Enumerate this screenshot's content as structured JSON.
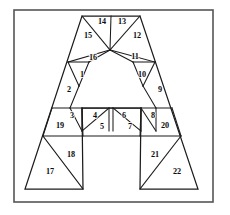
{
  "figure": {
    "background_color": "#ffffff",
    "ink_color": "#1b1b1b",
    "frame_color": "#555555",
    "frame": {
      "x": 14,
      "y": 10,
      "width": 199,
      "height": 192
    }
  },
  "chart_data": {
    "type": "diagram",
    "title": "",
    "region_count": 22,
    "vertices": {
      "apex_left": [
        82,
        16
      ],
      "apex_right": [
        140,
        16
      ],
      "hub": [
        110,
        50
      ],
      "shoulder_left": [
        68,
        62
      ],
      "shoulder_right": [
        155,
        62
      ],
      "bar_top_left": [
        52,
        108
      ],
      "bar_top_right": [
        172,
        108
      ],
      "bar_bottom_left": [
        43,
        136
      ],
      "bar_bottom_right": [
        181,
        136
      ],
      "foot_left_outer": [
        25,
        189
      ],
      "foot_left_inner": [
        83,
        189
      ],
      "foot_right_inner": [
        140,
        189
      ],
      "foot_right_outer": [
        198,
        189
      ],
      "counter_left": [
        82,
        108
      ],
      "counter_right": [
        141,
        108
      ],
      "inner_left_top": [
        89,
        62
      ],
      "inner_right_top": [
        133,
        62
      ]
    },
    "regions": [
      {
        "id": 1,
        "label": "1",
        "label_x": 82,
        "label_y": 75,
        "points": "68,62 89,62 79,86"
      },
      {
        "id": 2,
        "label": "2",
        "label_x": 69,
        "label_y": 90,
        "points": "68,62 79,86 70,108 52,108"
      },
      {
        "id": 3,
        "label": "3",
        "label_x": 72,
        "label_y": 116,
        "points": "70,108 82,108 82,131"
      },
      {
        "id": 4,
        "label": "4",
        "label_x": 95,
        "label_y": 116,
        "points": "82,108 109,108 82,131"
      },
      {
        "id": 5,
        "label": "5",
        "label_x": 102,
        "label_y": 127,
        "points": "109,108 109,131 82,131"
      },
      {
        "id": 6,
        "label": "6",
        "label_x": 124,
        "label_y": 116,
        "points": "113,108 141,108 141,131"
      },
      {
        "id": 7,
        "label": "7",
        "label_x": 130,
        "label_y": 127,
        "points": "113,108 141,131 113,131"
      },
      {
        "id": 8,
        "label": "8",
        "label_x": 153,
        "label_y": 116,
        "points": "141,108 156,108 156,131"
      },
      {
        "id": 9,
        "label": "9",
        "label_x": 160,
        "label_y": 90,
        "points": "155,62 172,108 156,108 143,86"
      },
      {
        "id": 10,
        "label": "10",
        "label_x": 142,
        "label_y": 75,
        "points": "155,62 143,86 133,62"
      },
      {
        "id": 11,
        "label": "11",
        "label_x": 135,
        "label_y": 57,
        "points": "110,50 155,62 133,62"
      },
      {
        "id": 12,
        "label": "12",
        "label_x": 137,
        "label_y": 36,
        "points": "110,50 140,16 155,62"
      },
      {
        "id": 13,
        "label": "13",
        "label_x": 122,
        "label_y": 22,
        "points": "110,50 111,16 140,16"
      },
      {
        "id": 14,
        "label": "14",
        "label_x": 102,
        "label_y": 22,
        "points": "110,50 82,16 111,16"
      },
      {
        "id": 15,
        "label": "15",
        "label_x": 88,
        "label_y": 36,
        "points": "110,50 68,62 82,16"
      },
      {
        "id": 16,
        "label": "16",
        "label_x": 93,
        "label_y": 58,
        "points": "110,50 89,62 68,62"
      },
      {
        "id": 17,
        "label": "17",
        "label_x": 50,
        "label_y": 172,
        "points": "25,189 43,136 83,189"
      },
      {
        "id": 18,
        "label": "18",
        "label_x": 71,
        "label_y": 155,
        "points": "43,136 83,136 83,189"
      },
      {
        "id": 19,
        "label": "19",
        "label_x": 60,
        "label_y": 126,
        "points": "52,108 70,108 82,131 43,136"
      },
      {
        "id": 20,
        "label": "20",
        "label_x": 165,
        "label_y": 126,
        "points": "156,108 172,108 181,136 156,131"
      },
      {
        "id": 21,
        "label": "21",
        "label_x": 155,
        "label_y": 155,
        "points": "140,136 181,136 140,189"
      },
      {
        "id": 22,
        "label": "22",
        "label_x": 177,
        "label_y": 172,
        "points": "181,136 198,189 140,189"
      }
    ],
    "outline_paths": [
      "M82,16 L140,16 L198,189 L140,189 L141,108 L82,108 L83,189 L25,189 Z"
    ],
    "partition_lines": [
      {
        "from": [
          82,
          16
        ],
        "to": [
          110,
          50
        ]
      },
      {
        "from": [
          111,
          16
        ],
        "to": [
          110,
          50
        ]
      },
      {
        "from": [
          140,
          16
        ],
        "to": [
          110,
          50
        ]
      },
      {
        "from": [
          68,
          62
        ],
        "to": [
          110,
          50
        ]
      },
      {
        "from": [
          89,
          62
        ],
        "to": [
          110,
          50
        ]
      },
      {
        "from": [
          133,
          62
        ],
        "to": [
          110,
          50
        ]
      },
      {
        "from": [
          155,
          62
        ],
        "to": [
          110,
          50
        ]
      },
      {
        "from": [
          68,
          62
        ],
        "to": [
          89,
          62
        ]
      },
      {
        "from": [
          133,
          62
        ],
        "to": [
          155,
          62
        ]
      },
      {
        "from": [
          68,
          62
        ],
        "to": [
          79,
          86
        ]
      },
      {
        "from": [
          89,
          62
        ],
        "to": [
          79,
          86
        ]
      },
      {
        "from": [
          79,
          86
        ],
        "to": [
          70,
          108
        ]
      },
      {
        "from": [
          155,
          62
        ],
        "to": [
          143,
          86
        ]
      },
      {
        "from": [
          133,
          62
        ],
        "to": [
          143,
          86
        ]
      },
      {
        "from": [
          143,
          86
        ],
        "to": [
          156,
          108
        ]
      },
      {
        "from": [
          52,
          108
        ],
        "to": [
          172,
          108
        ]
      },
      {
        "from": [
          43,
          136
        ],
        "to": [
          181,
          136
        ]
      },
      {
        "from": [
          70,
          108
        ],
        "to": [
          82,
          131
        ]
      },
      {
        "from": [
          82,
          108
        ],
        "to": [
          82,
          131
        ]
      },
      {
        "from": [
          109,
          108
        ],
        "to": [
          82,
          131
        ]
      },
      {
        "from": [
          109,
          108
        ],
        "to": [
          109,
          131
        ]
      },
      {
        "from": [
          113,
          108
        ],
        "to": [
          113,
          131
        ]
      },
      {
        "from": [
          113,
          108
        ],
        "to": [
          141,
          131
        ]
      },
      {
        "from": [
          141,
          108
        ],
        "to": [
          141,
          131
        ]
      },
      {
        "from": [
          141,
          108
        ],
        "to": [
          156,
          131
        ]
      },
      {
        "from": [
          156,
          108
        ],
        "to": [
          156,
          131
        ]
      },
      {
        "from": [
          52,
          108
        ],
        "to": [
          43,
          136
        ]
      },
      {
        "from": [
          172,
          108
        ],
        "to": [
          181,
          136
        ]
      },
      {
        "from": [
          43,
          136
        ],
        "to": [
          83,
          189
        ]
      },
      {
        "from": [
          181,
          136
        ],
        "to": [
          140,
          189
        ]
      },
      {
        "from": [
          82,
          108
        ],
        "to": [
          83,
          136
        ]
      },
      {
        "from": [
          141,
          108
        ],
        "to": [
          140,
          136
        ]
      }
    ]
  }
}
